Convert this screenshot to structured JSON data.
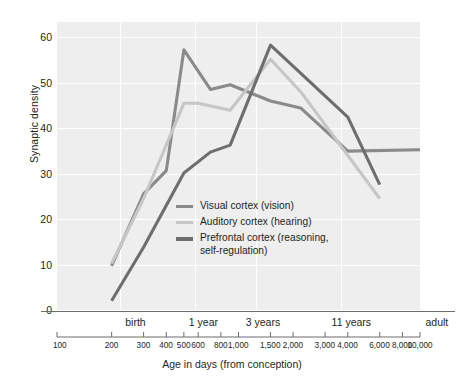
{
  "chart_data": {
    "type": "line",
    "title": "",
    "xlabel": "Age in days (from conception)",
    "ylabel": "Synaptic density",
    "xscale": "log",
    "xlim": [
      100,
      10000
    ],
    "ylim": [
      0,
      62
    ],
    "yticks": [
      0,
      10,
      20,
      30,
      40,
      50,
      60
    ],
    "xticks": [
      100,
      200,
      300,
      400,
      500,
      600,
      800,
      1000,
      1500,
      2000,
      3000,
      4000,
      6000,
      8000,
      10000
    ],
    "xticklabels": [
      "100",
      "200",
      "300",
      "400",
      "500",
      "600",
      "800",
      "1,000",
      "1,500",
      "2,000",
      "3,000",
      "4,000",
      "6,000",
      "8,000",
      "10,000"
    ],
    "age_markers": [
      {
        "label": "birth",
        "days": 270
      },
      {
        "label": "1 year",
        "days": 640
      },
      {
        "label": "3 years",
        "days": 1360
      },
      {
        "label": "11 years",
        "days": 4200
      },
      {
        "label": "adult",
        "days": 10000
      }
    ],
    "grid": true,
    "legend_position": "center-left-inside",
    "series": [
      {
        "name": "Visual cortex (vision)",
        "color": "#8a8a8a",
        "x": [
          200,
          300,
          400,
          500,
          700,
          900,
          1500,
          2200,
          4000,
          10000
        ],
        "y": [
          9.5,
          25,
          30,
          56,
          47.5,
          48.5,
          45,
          43.5,
          34.2,
          34.5
        ]
      },
      {
        "name": "Auditory cortex (hearing)",
        "color": "#c6c6c6",
        "x": [
          200,
          300,
          500,
          600,
          900,
          1500,
          2200,
          6000
        ],
        "y": [
          10,
          24,
          44.5,
          44.5,
          43,
          54,
          47,
          24
        ]
      },
      {
        "name": "Prefrontal cortex (reasoning, self-regulation)",
        "color": "#6e6e6e",
        "x": [
          200,
          300,
          500,
          700,
          900,
          1500,
          4000,
          6000
        ],
        "y": [
          2,
          13.5,
          29.5,
          34,
          35.5,
          57,
          41.5,
          27
        ]
      }
    ]
  },
  "legend": {
    "items": [
      {
        "label": "Visual cortex (vision)",
        "color": "#8a8a8a"
      },
      {
        "label": "Auditory cortex (hearing)",
        "color": "#c6c6c6"
      },
      {
        "label": "Prefrontal cortex (reasoning,",
        "label2": "self-regulation)",
        "color": "#6e6e6e"
      }
    ]
  },
  "axes": {
    "y_title": "Synaptic density",
    "x_title": "Age in days (from conception)",
    "y_tick_labels": [
      "60",
      "50",
      "40",
      "30",
      "20",
      "10",
      "0"
    ],
    "x_tick_labels": [
      "100",
      "200",
      "300",
      "400",
      "500",
      "600",
      "800",
      "1,000",
      "1,500",
      "2,000",
      "3,000",
      "4,000",
      "6,000",
      "8,000",
      "10,000"
    ],
    "age_labels": [
      "birth",
      "1 year",
      "3 years",
      "11 years",
      "adult"
    ]
  },
  "colors": {
    "plot_background": "#eeeeee",
    "grid": "#ffffff",
    "axis_line": "#6d6d6d",
    "text": "#231f20"
  }
}
